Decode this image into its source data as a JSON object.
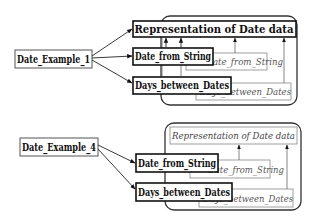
{
  "diagrams": [
    {
      "source": "Date_Example_1",
      "container_label": "Representation of Date data",
      "container_label_style": "bold",
      "targets": [
        "Representation of Date data",
        "Date_from_String",
        "Days_between_Dates"
      ],
      "ghost_nodes": [
        "Date_from_String",
        "Days_between_Dates"
      ]
    },
    {
      "source": "Date_Example_4",
      "container_label": "Representation of Date data",
      "container_label_style": "italic",
      "targets": [
        "Date_from_String",
        "Days_between_Dates"
      ],
      "ghost_nodes": [
        "Date_from_String",
        "Days_between_Dates"
      ]
    }
  ],
  "labels": {
    "d1_source": "Date_Example_1",
    "d1_repr": "Representation of Date data",
    "d1_from_string": "Date_from_String",
    "d1_days_between": "Days_between_Dates",
    "d1_ghost_from_string": "Date_from_String",
    "d1_ghost_days_between": "Days_between_Dates",
    "d4_source": "Date_Example_4",
    "d4_repr": "Representation of Date data",
    "d4_from_string": "Date_from_String",
    "d4_days_between": "Days_between_Dates",
    "d4_ghost_from_string": "Date_from_String",
    "d4_ghost_days_between": "Days_between_Dates"
  }
}
